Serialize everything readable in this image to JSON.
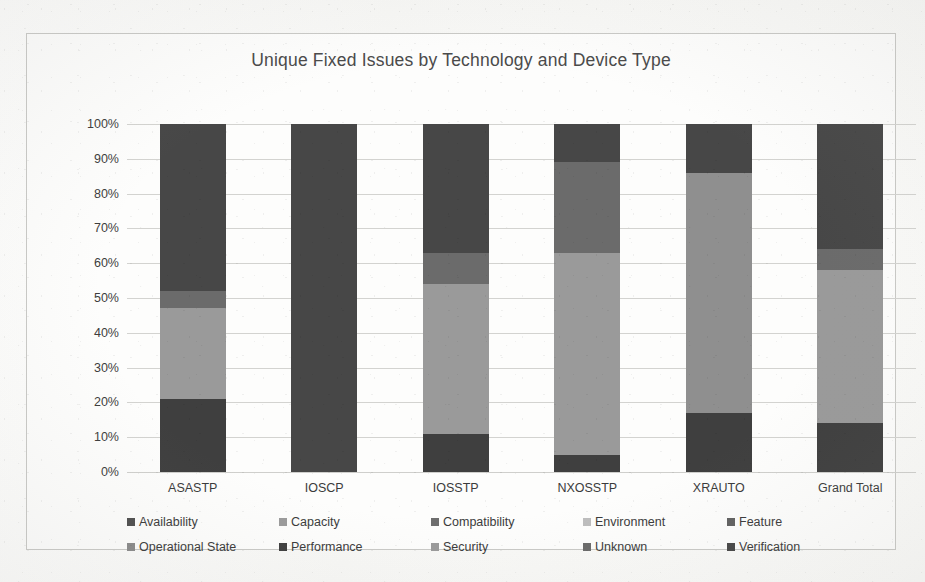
{
  "chart_data": {
    "type": "bar",
    "subtype": "100% stacked column",
    "title": "Unique Fixed Issues by Technology and Device Type",
    "xlabel": "",
    "ylabel": "",
    "ylim": [
      0,
      100
    ],
    "ytick_labels": [
      "100%",
      "90%",
      "80%",
      "70%",
      "60%",
      "50%",
      "40%",
      "30%",
      "20%",
      "10%",
      "0%"
    ],
    "ytick_values": [
      100,
      90,
      80,
      70,
      60,
      50,
      40,
      30,
      20,
      10,
      0
    ],
    "grid": true,
    "legend_position": "bottom",
    "categories": [
      "ASASTP",
      "IOSCP",
      "IOSSTP",
      "NXOSSTP",
      "XRAUTO",
      "Grand Total"
    ],
    "series": [
      {
        "name": "Availability",
        "color": "#4f4f4f",
        "values": [
          0,
          0,
          0,
          0,
          0,
          0
        ]
      },
      {
        "name": "Capacity",
        "color": "#9b9b9b",
        "values": [
          0,
          0,
          0,
          0,
          0,
          0
        ]
      },
      {
        "name": "Compatibility",
        "color": "#6e6e6e",
        "values": [
          0,
          0,
          0,
          0,
          0,
          0
        ]
      },
      {
        "name": "Environment",
        "color": "#bdbdbd",
        "values": [
          0,
          0,
          0,
          0,
          0,
          0
        ]
      },
      {
        "name": "Feature",
        "color": "#616161",
        "values": [
          0,
          0,
          0,
          0,
          0,
          0
        ]
      },
      {
        "name": "Operational State",
        "color": "#8a8a8a",
        "values": [
          0,
          0,
          0,
          0,
          0,
          0
        ]
      },
      {
        "name": "Performance",
        "color": "#3f3f3f",
        "values": [
          21,
          0,
          11,
          5,
          17,
          14
        ]
      },
      {
        "name": "Security",
        "color": "#9a9a9a",
        "values": [
          26,
          0,
          43,
          58,
          69,
          44
        ]
      },
      {
        "name": "Unknown",
        "color": "#6b6b6b",
        "values": [
          5,
          100,
          9,
          26,
          0,
          6
        ]
      },
      {
        "name": "Verification",
        "color": "#474747",
        "values": [
          48,
          0,
          37,
          11,
          14,
          36
        ]
      }
    ],
    "stacks": [
      {
        "category": "ASASTP",
        "segments": [
          {
            "series": "Performance",
            "from": 0,
            "to": 21,
            "color": "#3f3f3f"
          },
          {
            "series": "Security",
            "from": 21,
            "to": 47,
            "color": "#9a9a9a"
          },
          {
            "series": "Unknown",
            "from": 47,
            "to": 52,
            "color": "#6b6b6b"
          },
          {
            "series": "Verification",
            "from": 52,
            "to": 100,
            "color": "#474747"
          }
        ]
      },
      {
        "category": "IOSCP",
        "segments": [
          {
            "series": "Unknown",
            "from": 0,
            "to": 100,
            "color": "#474747"
          }
        ]
      },
      {
        "category": "IOSSTP",
        "segments": [
          {
            "series": "Performance",
            "from": 0,
            "to": 11,
            "color": "#3f3f3f"
          },
          {
            "series": "Security",
            "from": 11,
            "to": 54,
            "color": "#9a9a9a"
          },
          {
            "series": "Unknown",
            "from": 54,
            "to": 63,
            "color": "#6b6b6b"
          },
          {
            "series": "Verification",
            "from": 63,
            "to": 100,
            "color": "#474747"
          }
        ]
      },
      {
        "category": "NXOSSTP",
        "segments": [
          {
            "series": "Performance",
            "from": 0,
            "to": 5,
            "color": "#3f3f3f"
          },
          {
            "series": "Security",
            "from": 5,
            "to": 63,
            "color": "#9a9a9a"
          },
          {
            "series": "Unknown",
            "from": 63,
            "to": 89,
            "color": "#6b6b6b"
          },
          {
            "series": "Verification",
            "from": 89,
            "to": 100,
            "color": "#474747"
          }
        ]
      },
      {
        "category": "XRAUTO",
        "segments": [
          {
            "series": "Performance",
            "from": 0,
            "to": 17,
            "color": "#3f3f3f"
          },
          {
            "series": "Security",
            "from": 17,
            "to": 86,
            "color": "#8f8f8f"
          },
          {
            "series": "Verification",
            "from": 86,
            "to": 100,
            "color": "#474747"
          }
        ]
      },
      {
        "category": "Grand Total",
        "segments": [
          {
            "series": "Performance",
            "from": 0,
            "to": 14,
            "color": "#3f3f3f"
          },
          {
            "series": "Security",
            "from": 14,
            "to": 58,
            "color": "#9a9a9a"
          },
          {
            "series": "Unknown",
            "from": 58,
            "to": 64,
            "color": "#6b6b6b"
          },
          {
            "series": "Verification",
            "from": 64,
            "to": 100,
            "color": "#474747"
          }
        ]
      }
    ],
    "legend": [
      {
        "label": "Availability",
        "color": "#4f4f4f"
      },
      {
        "label": "Capacity",
        "color": "#9b9b9b"
      },
      {
        "label": "Compatibility",
        "color": "#6e6e6e"
      },
      {
        "label": "Environment",
        "color": "#bdbdbd"
      },
      {
        "label": "Feature",
        "color": "#616161"
      },
      {
        "label": "Operational State",
        "color": "#8a8a8a"
      },
      {
        "label": "Performance",
        "color": "#3f3f3f"
      },
      {
        "label": "Security",
        "color": "#9a9a9a"
      },
      {
        "label": "Unknown",
        "color": "#6b6b6b"
      },
      {
        "label": "Verification",
        "color": "#474747"
      }
    ]
  }
}
